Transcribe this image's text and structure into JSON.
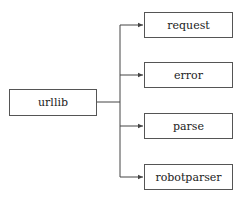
{
  "diagram": {
    "type": "tree",
    "root": {
      "label": "urllib"
    },
    "children": [
      {
        "label": "request"
      },
      {
        "label": "error"
      },
      {
        "label": "parse"
      },
      {
        "label": "robotparser"
      }
    ],
    "colors": {
      "line": "#444444",
      "box_border": "#555555",
      "text": "#222222",
      "background": "#ffffff"
    }
  }
}
